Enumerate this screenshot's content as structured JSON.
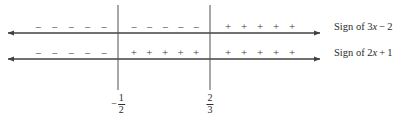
{
  "figure": {
    "type": "sign-chart",
    "background_color": "#ffffff",
    "line_color": "#404040",
    "text_color": "#2b2b2b",
    "width": 401,
    "height": 120
  },
  "number_lines": [
    {
      "id": "line-top",
      "label": "Sign of 3x − 2",
      "label_parts": {
        "prefix": "Sign of ",
        "coefficient": "3",
        "variable": "x",
        "operator": "−",
        "constant": "2"
      },
      "y": 33,
      "x_start": 8,
      "x_end": 320,
      "arrow_left": true,
      "arrow_right": true,
      "sign_groups": [
        {
          "sign": "−",
          "count": 5,
          "x_start": 30,
          "x_end": 112
        },
        {
          "sign": "−",
          "count": 5,
          "x_start": 126,
          "x_end": 204
        },
        {
          "sign": "+",
          "count": 5,
          "x_start": 220,
          "x_end": 300
        }
      ]
    },
    {
      "id": "line-bottom",
      "label": "Sign of 2x + 1",
      "label_parts": {
        "prefix": "Sign of ",
        "coefficient": "2",
        "variable": "x",
        "operator": "+",
        "constant": "1"
      },
      "y": 59,
      "x_start": 8,
      "x_end": 320,
      "arrow_left": true,
      "arrow_right": true,
      "sign_groups": [
        {
          "sign": "−",
          "count": 5,
          "x_start": 30,
          "x_end": 112
        },
        {
          "sign": "+",
          "count": 5,
          "x_start": 126,
          "x_end": 204
        },
        {
          "sign": "+",
          "count": 5,
          "x_start": 220,
          "x_end": 300
        }
      ]
    }
  ],
  "critical_points": [
    {
      "id": "critical-point-neg-one-half",
      "x": 118,
      "value": "-1/2",
      "negative": true,
      "numerator": "1",
      "denominator": "2",
      "line_top": 5,
      "line_bottom": 90,
      "label_y": 93
    },
    {
      "id": "critical-point-two-thirds",
      "x": 210,
      "value": "2/3",
      "negative": false,
      "numerator": "2",
      "denominator": "3",
      "line_top": 5,
      "line_bottom": 90,
      "label_y": 93
    }
  ],
  "labels": {
    "top_label_x": 334,
    "top_label_y": 21,
    "bottom_label_x": 334,
    "bottom_label_y": 47
  }
}
